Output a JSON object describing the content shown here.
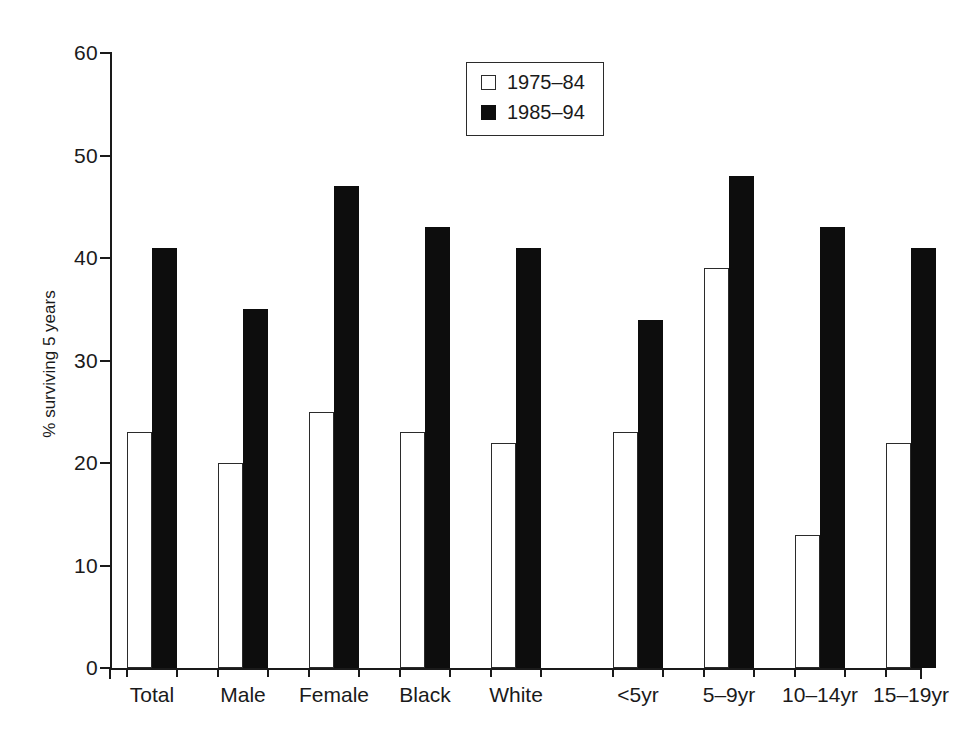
{
  "chart_data": {
    "type": "bar",
    "title": "",
    "subtitle": "",
    "xlabel": "",
    "ylabel": "% surviving 5 years",
    "ylim": [
      0,
      60
    ],
    "yticks": [
      0,
      10,
      20,
      30,
      40,
      50,
      60
    ],
    "ytick_labels": [
      "0",
      "10",
      "20",
      "30",
      "40",
      "50",
      "60"
    ],
    "grid": false,
    "legend_position": "top-center",
    "categories": [
      "Total",
      "Male",
      "Female",
      "Black",
      "White",
      "<5yr",
      "5–9yr",
      "10–14yr",
      "15–19yr"
    ],
    "group_break_after": "White",
    "series": [
      {
        "name": "1975–84",
        "style": "open",
        "color": "#ffffff",
        "edge_color": "#2b2b2b",
        "values": [
          23,
          20,
          25,
          23,
          22,
          23,
          39,
          13,
          22
        ]
      },
      {
        "name": "1985–94",
        "style": "filled",
        "color": "#0d0d0d",
        "edge_color": "#0d0d0d",
        "values": [
          41,
          35,
          47,
          43,
          41,
          34,
          48,
          43,
          41
        ]
      }
    ]
  },
  "legend": {
    "entries": [
      {
        "label": "1975–84",
        "swatch": "open"
      },
      {
        "label": "1985–94",
        "swatch": "filled"
      }
    ]
  },
  "axes": {
    "y_title": "% surviving 5 years",
    "y_tick_labels": [
      "60",
      "50",
      "40",
      "30",
      "20",
      "10",
      "0"
    ],
    "x_group_labels": [
      "Total",
      "Male",
      "Female",
      "Black",
      "White",
      "<5yr",
      "5–9yr",
      "10–14yr",
      "15–19yr"
    ]
  },
  "colors": {
    "axis": "#1a1a1a",
    "bar_open_fill": "#ffffff",
    "bar_open_edge": "#2b2b2b",
    "bar_filled": "#0d0d0d",
    "background": "#ffffff"
  }
}
